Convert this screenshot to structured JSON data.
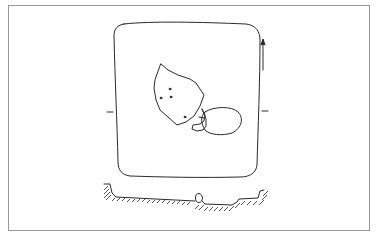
{
  "figure": {
    "type": "archaeological-grave-plan",
    "caption": "",
    "elements": {
      "plan": "square grave pit outline with rounded corners",
      "stone_large": "irregular stone with three marks",
      "stone_oval": "oval stone",
      "stone_small": "small stone fragments",
      "north_arrow": "north arrow",
      "section_markers": "section line markers",
      "section": "cross-section profile with hatched ground and stone"
    },
    "colors": {
      "line": "#2a2a2a",
      "frame": "#9a9a9a",
      "background": "#ffffff"
    }
  }
}
